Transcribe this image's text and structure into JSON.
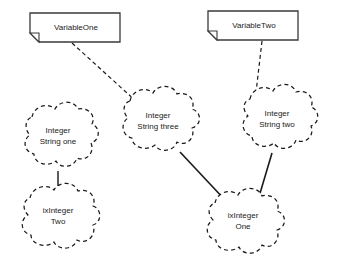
{
  "diagram": {
    "type": "object-diagram",
    "background_color": "#ffffff",
    "stroke_color": "#1a1a1a",
    "notes": [
      {
        "id": "variable-one",
        "label": "VariableOne",
        "shape": "note-folded-corner",
        "x": 30,
        "y": 13,
        "width": 90,
        "height": 29
      },
      {
        "id": "variable-two",
        "label": "VariableTwo",
        "shape": "note-folded-corner",
        "x": 208,
        "y": 11,
        "width": 90,
        "height": 29
      }
    ],
    "clouds": [
      {
        "id": "integer-string-one",
        "line1": "Integer",
        "line2": "String one",
        "shape": "cloud-dashed",
        "cx": 57,
        "cy": 143
      },
      {
        "id": "integer-string-three",
        "line1": "Integer",
        "line2": "String three",
        "shape": "cloud-dashed",
        "cx": 157,
        "cy": 127
      },
      {
        "id": "integer-string-two",
        "line1": "Integer",
        "line2": "String two",
        "shape": "cloud-dashed",
        "cx": 276,
        "cy": 125
      },
      {
        "id": "ix-integer-two",
        "line1": "ixInteger",
        "line2": "Two",
        "shape": "cloud-dashed",
        "cx": 57,
        "cy": 222
      },
      {
        "id": "ix-integer-one",
        "line1": "ixInteger",
        "line2": "One",
        "shape": "cloud-dashed",
        "cx": 242,
        "cy": 227
      }
    ],
    "connectors": [
      {
        "id": "variable-one-to-string-three",
        "style": "dashed",
        "from": "variable-one",
        "to": "integer-string-three"
      },
      {
        "id": "variable-two-to-string-two",
        "style": "dashed",
        "from": "variable-two",
        "to": "integer-string-two"
      },
      {
        "id": "string-one-to-ix-integer-two",
        "style": "solid",
        "from": "integer-string-one",
        "to": "ix-integer-two"
      },
      {
        "id": "string-three-to-ix-integer-one",
        "style": "solid",
        "from": "integer-string-three",
        "to": "ix-integer-one"
      },
      {
        "id": "string-two-to-ix-integer-one",
        "style": "solid",
        "from": "integer-string-two",
        "to": "ix-integer-one"
      }
    ]
  }
}
